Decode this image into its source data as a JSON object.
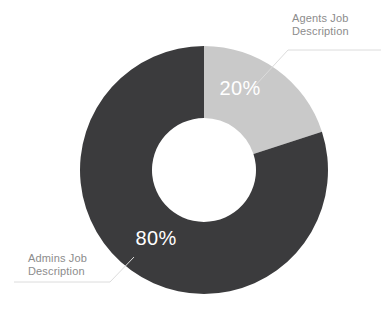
{
  "chart_data": {
    "type": "pie",
    "variant": "donut",
    "title": "",
    "subtitle": "",
    "xlabel": "",
    "ylabel": "",
    "grid": false,
    "legend_position": "callout-labels",
    "background_color": "#ffffff",
    "center": {
      "x": 204,
      "y": 170
    },
    "outer_radius": 124,
    "inner_radius": 52,
    "start_angle_deg": 0,
    "direction": "clockwise",
    "categories": [
      "Agents Job Description",
      "Admins Job Description"
    ],
    "values": [
      20,
      80
    ],
    "value_labels": [
      "20%",
      "80%"
    ],
    "colors": [
      "#c9c9c9",
      "#3b3b3d"
    ],
    "value_label_color": "#ffffff",
    "callout_text_color": "#8c8c8c",
    "leader_line_color": "#dcdcdc",
    "slices": [
      {
        "name": "Agents Job Description",
        "value": 20,
        "value_label": "20%",
        "color": "#c9c9c9",
        "start_angle_deg": 0,
        "end_angle_deg": 72,
        "value_label_x": 240,
        "value_label_y": 95,
        "callout": {
          "line1": "Agents Job",
          "line2": "Description",
          "text_x": 292,
          "line1_y": 22,
          "line2_y": 35,
          "leader_path": "M 253 88 L 288 50 L 381 50"
        }
      },
      {
        "name": "Admins Job Description",
        "value": 80,
        "value_label": "80%",
        "color": "#3b3b3d",
        "start_angle_deg": 72,
        "end_angle_deg": 360,
        "value_label_x": 156,
        "value_label_y": 245,
        "callout": {
          "line1": "Admins Job",
          "line2": "Description",
          "text_x": 28,
          "line1_y": 262,
          "line2_y": 275,
          "leader_path": "M 134 257 L 110 282 L 14 282"
        }
      }
    ]
  }
}
